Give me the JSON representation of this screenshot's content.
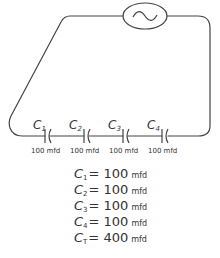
{
  "diagram": {
    "type": "series-capacitor-circuit",
    "source": {
      "icon": "ac-source-icon",
      "symbol": "~"
    },
    "capacitors": [
      {
        "name": "C",
        "sub": "1",
        "value": "100 mfd"
      },
      {
        "name": "C",
        "sub": "2",
        "value": "100 mfd"
      },
      {
        "name": "C",
        "sub": "3",
        "value": "100 mfd"
      },
      {
        "name": "C",
        "sub": "4",
        "value": "100 mfd"
      }
    ],
    "equations": [
      {
        "name": "C",
        "sub": "1",
        "eq": "= 100",
        "unit": "mfd"
      },
      {
        "name": "C",
        "sub": "2",
        "eq": "= 100",
        "unit": "mfd"
      },
      {
        "name": "C",
        "sub": "3",
        "eq": "= 100",
        "unit": "mfd"
      },
      {
        "name": "C",
        "sub": "4",
        "eq": "= 100",
        "unit": "mfd"
      },
      {
        "name": "C",
        "sub": "T",
        "eq": "= 400",
        "unit": "mfd"
      }
    ],
    "colors": {
      "stroke": "#444444",
      "text": "#333333",
      "background": "#ffffff"
    }
  }
}
